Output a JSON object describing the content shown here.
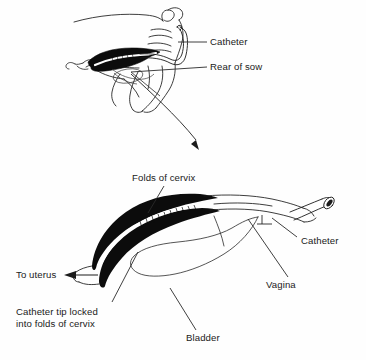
{
  "figure": {
    "type": "anatomical-line-diagram",
    "background_color": "#fefefe",
    "ink_color": "#111111",
    "panels": [
      {
        "id": "top",
        "name": "rear-of-sow-overview",
        "description": "Side view of the hindquarters of a sow with the reproductive tract and inserted catheter shown in outline"
      },
      {
        "id": "bottom",
        "name": "cervix-detail",
        "description": "Enlarged detail of cervix, vagina and bladder with catheter tip locked into the cervical folds"
      }
    ]
  },
  "labels": {
    "catheter_top": "Catheter",
    "rear_of_sow": "Rear of sow",
    "folds_of_cervix": "Folds of cervix",
    "to_uterus": "To uterus",
    "catheter_tip_locked": "Catheter tip locked\ninto folds of cervix",
    "catheter_bottom": "Catheter",
    "vagina": "Vagina",
    "bladder": "Bladder"
  },
  "colors": {
    "ink": "#111111",
    "cervix_fill": "#0c0c0c",
    "lumen": "#ffffff",
    "leader_line": "#2a2a2a",
    "paper": "#fefefe"
  }
}
